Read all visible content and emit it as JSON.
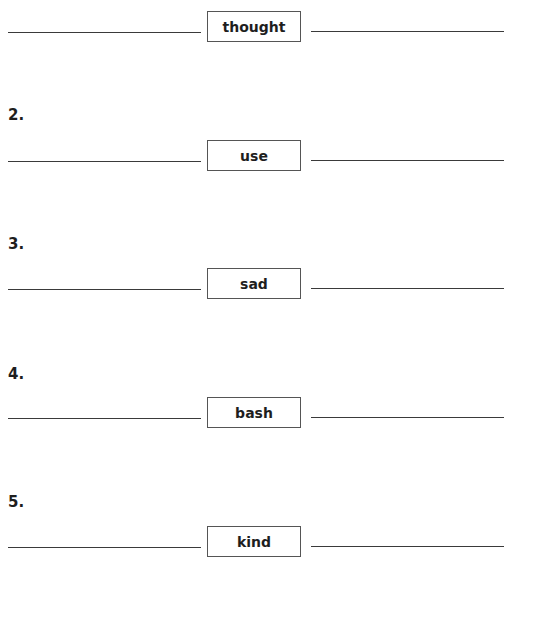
{
  "worksheet": {
    "items": [
      {
        "number": "",
        "word": "thought"
      },
      {
        "number": "2.",
        "word": "use"
      },
      {
        "number": "3.",
        "word": "sad"
      },
      {
        "number": "4.",
        "word": "bash"
      },
      {
        "number": "5.",
        "word": "kind"
      }
    ]
  },
  "colors": {
    "text": "#1e1e1e",
    "line": "#3a3a3a",
    "box_border": "#555555",
    "background": "#ffffff"
  }
}
